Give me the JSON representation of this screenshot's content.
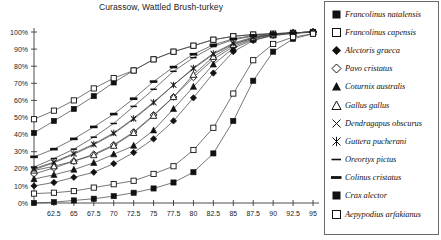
{
  "chart_data": {
    "type": "line",
    "title": "Curassow, Wattled Brush-turkey",
    "xlabel": "",
    "ylabel": "",
    "xlim": [
      60,
      95
    ],
    "ylim": [
      0,
      100
    ],
    "grid": false,
    "legend_position": "right",
    "x_ticks": [
      "62.5",
      "65",
      "67.5",
      "70",
      "72.5",
      "75",
      "77.5",
      "80",
      "82.5",
      "85",
      "87.5",
      "90",
      "92.5",
      "95"
    ],
    "x_tick_values": [
      62.5,
      65,
      67.5,
      70,
      72.5,
      75,
      77.5,
      80,
      82.5,
      85,
      87.5,
      90,
      92.5,
      95
    ],
    "y_ticks": [
      "0%",
      "10%",
      "20%",
      "30%",
      "40%",
      "50%",
      "60%",
      "70%",
      "80%",
      "90%",
      "100%"
    ],
    "y_tick_values": [
      0,
      10,
      20,
      30,
      40,
      50,
      60,
      70,
      80,
      90,
      100
    ],
    "x": [
      60,
      62.5,
      65,
      67.5,
      70,
      72.5,
      75,
      77.5,
      80,
      82.5,
      85,
      87.5,
      90,
      92.5,
      95
    ],
    "series": [
      {
        "name": "Francolinus natalensis",
        "marker": "filled-square",
        "values": [
          41,
          48,
          55,
          62.5,
          70.5,
          77.5,
          84,
          88.5,
          92,
          95.5,
          97.5,
          98.5,
          99,
          99.5,
          100
        ]
      },
      {
        "name": "Francolinus capensis",
        "marker": "open-square",
        "values": [
          49,
          54,
          60,
          67,
          73,
          77.5,
          84,
          88.5,
          92,
          95.5,
          97.5,
          98.5,
          99,
          99.5,
          100
        ]
      },
      {
        "name": "Alectoris graeca",
        "marker": "filled-diamond",
        "values": [
          10,
          12,
          15,
          18,
          23,
          29.5,
          37.5,
          48,
          61.5,
          76,
          88.5,
          95,
          98,
          99,
          100
        ]
      },
      {
        "name": "Pavo cristatus",
        "marker": "open-diamond",
        "values": [
          17,
          20.5,
          24.5,
          28.5,
          34,
          41.5,
          51.5,
          62,
          73.5,
          84,
          91.5,
          96,
          98.5,
          99.5,
          100
        ]
      },
      {
        "name": "Coturnix australis",
        "marker": "filled-triangle",
        "values": [
          14,
          16.5,
          19.5,
          23.5,
          28.5,
          33.5,
          42.5,
          55,
          68,
          81,
          90.5,
          95.5,
          98,
          99.5,
          100
        ]
      },
      {
        "name": "Gallus gallus",
        "marker": "open-triangle",
        "values": [
          19,
          21.5,
          24.5,
          28,
          33.5,
          41,
          51,
          62,
          75,
          85.5,
          92.5,
          96.5,
          98.5,
          99.5,
          100
        ]
      },
      {
        "name": "Dendragapus obscurus",
        "marker": "x-cross",
        "values": [
          19.5,
          23.5,
          28.5,
          34,
          40.5,
          49,
          58.5,
          69,
          78.5,
          87,
          93,
          96.5,
          98.5,
          99.5,
          100
        ]
      },
      {
        "name": "Guttera pucherani",
        "marker": "asterisk",
        "values": [
          20,
          24,
          29,
          34.5,
          41,
          49.5,
          59,
          69,
          79,
          87.5,
          93.5,
          97,
          98.5,
          99.5,
          100
        ]
      },
      {
        "name": "Oreortyx pictus",
        "marker": "thin-dash",
        "values": [
          21,
          26,
          31.5,
          38.5,
          46.5,
          56.5,
          66.5,
          77,
          85,
          91.5,
          95.5,
          97.5,
          98.5,
          99.5,
          100
        ]
      },
      {
        "name": "Colinus cristatus",
        "marker": "thick-dash",
        "values": [
          27,
          31.5,
          37.5,
          44.5,
          52,
          61,
          71,
          79.5,
          87,
          92.5,
          96,
          98,
          99,
          99.5,
          100
        ]
      },
      {
        "name": "Crax alector",
        "marker": "filled-square",
        "values": [
          0,
          0.5,
          1.5,
          2.5,
          4,
          6,
          8.5,
          12,
          18,
          29,
          48,
          71.5,
          88.5,
          96,
          99
        ]
      },
      {
        "name": "Aepypodius arfakianus",
        "marker": "open-square",
        "values": [
          5.5,
          6,
          7,
          9,
          11,
          13,
          17,
          21.5,
          31,
          44,
          64,
          83.5,
          93,
          97,
          99
        ]
      }
    ]
  },
  "legend": {
    "items": [
      {
        "label": "Francolinus natalensis",
        "marker": "filled-square"
      },
      {
        "label": "Francolinus capensis",
        "marker": "open-square"
      },
      {
        "label": "Alectoris graeca",
        "marker": "filled-diamond"
      },
      {
        "label": "Pavo cristatus",
        "marker": "open-diamond"
      },
      {
        "label": "Coturnix australis",
        "marker": "filled-triangle"
      },
      {
        "label": "Gallus gallus",
        "marker": "open-triangle"
      },
      {
        "label": "Dendragapus obscurus",
        "marker": "x-cross"
      },
      {
        "label": "Guttera pucherani",
        "marker": "asterisk"
      },
      {
        "label": "Oreortyx pictus",
        "marker": "thin-dash"
      },
      {
        "label": "Colinus cristatus",
        "marker": "thick-dash"
      },
      {
        "label": "Crax alector",
        "marker": "filled-square"
      },
      {
        "label": "Aepypodius arfakianus",
        "marker": "open-square"
      }
    ]
  },
  "colors": {
    "marker": "#111111",
    "line": "#4a4a4a",
    "axis": "#3a3a3a",
    "text": "#1b1b1b",
    "background": "#ffffff"
  }
}
